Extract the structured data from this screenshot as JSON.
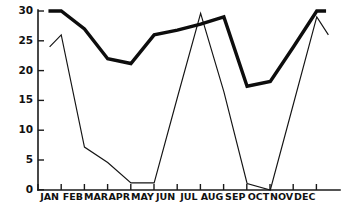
{
  "chart_data": {
    "type": "line",
    "title": "",
    "xlabel": "",
    "ylabel": "",
    "grid": false,
    "legend": "none",
    "xlim": [
      0,
      13
    ],
    "ylim": [
      0,
      30
    ],
    "categories": [
      "JAN",
      "FEB",
      "MAR",
      "APR",
      "MAY",
      "JUN",
      "JUL",
      "AUG",
      "SEP",
      "OCT",
      "NOV",
      "DEC"
    ],
    "y_ticks": [
      0,
      5,
      10,
      15,
      20,
      25,
      30
    ],
    "series": [
      {
        "name": "thick-line",
        "style": "thick",
        "values": [
          30,
          27,
          22,
          21.2,
          26,
          26.8,
          27.8,
          29,
          17.4,
          18.2,
          24,
          30
        ],
        "extra_points": [
          {
            "x": 0.45,
            "y": 30,
            "note": "flat start segment"
          },
          {
            "x": 12.4,
            "y": 30,
            "note": "flat end segment"
          }
        ]
      },
      {
        "name": "thin-line",
        "style": "thin",
        "values": [
          26,
          7.2,
          4.6,
          1.2,
          1.2,
          15.5,
          29.6,
          16.5,
          1.1,
          0,
          14.5,
          29
        ],
        "extra_points": [
          {
            "x": 0.5,
            "y": 24,
            "note": "early kink"
          },
          {
            "x": 12.5,
            "y": 26,
            "note": "trailing descent"
          }
        ]
      }
    ]
  }
}
